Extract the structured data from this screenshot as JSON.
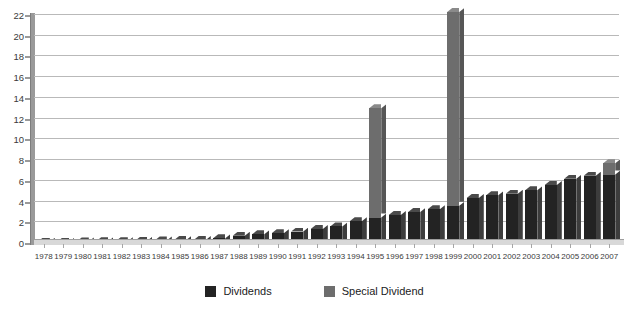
{
  "chart_data": {
    "type": "bar",
    "title": "",
    "subtitle": "",
    "xlabel": "",
    "ylabel": "",
    "ylim": [
      0,
      22
    ],
    "ytick_step": 2,
    "yticks": [
      0,
      2,
      4,
      6,
      8,
      10,
      12,
      14,
      16,
      18,
      20,
      22
    ],
    "grid": true,
    "stacked": true,
    "legend_position": "bottom-center",
    "categories": [
      "1978",
      "1979",
      "1980",
      "1981",
      "1982",
      "1983",
      "1984",
      "1985",
      "1986",
      "1987",
      "1988",
      "1989",
      "1990",
      "1991",
      "1992",
      "1993",
      "1994",
      "1995",
      "1996",
      "1997",
      "1998",
      "1999",
      "2000",
      "2001",
      "2002",
      "2003",
      "2004",
      "2005",
      "2006",
      "2007"
    ],
    "series": [
      {
        "name": "Dividends",
        "color": "#232323",
        "values": [
          0.12,
          0.13,
          0.15,
          0.17,
          0.18,
          0.22,
          0.25,
          0.28,
          0.3,
          0.45,
          0.7,
          0.85,
          0.95,
          1.1,
          1.35,
          1.6,
          2.1,
          2.45,
          2.7,
          3.0,
          3.25,
          3.6,
          4.35,
          4.6,
          4.75,
          5.1,
          5.6,
          6.2,
          6.5,
          6.6
        ]
      },
      {
        "name": "Special Dividend",
        "color": "#6d6d6d",
        "values": [
          0,
          0,
          0,
          0,
          0,
          0,
          0,
          0,
          0,
          0,
          0,
          0,
          0,
          0,
          0,
          0,
          0,
          10.55,
          0,
          0,
          0,
          18.7,
          0,
          0,
          0,
          0,
          0,
          0,
          0,
          1.1
        ]
      }
    ],
    "totals": [
      0.12,
      0.13,
      0.15,
      0.17,
      0.18,
      0.22,
      0.25,
      0.28,
      0.3,
      0.45,
      0.7,
      0.85,
      0.95,
      1.1,
      1.35,
      1.6,
      2.1,
      13.0,
      2.7,
      3.0,
      3.25,
      22.3,
      4.35,
      4.6,
      4.75,
      5.1,
      5.6,
      6.2,
      6.5,
      7.7
    ]
  },
  "legend": {
    "items": [
      {
        "label": "Dividends",
        "color": "#232323",
        "swatch_name": "legend-swatch-dividends"
      },
      {
        "label": "Special Dividend",
        "color": "#6d6d6d",
        "swatch_name": "legend-swatch-special-dividend"
      }
    ]
  }
}
